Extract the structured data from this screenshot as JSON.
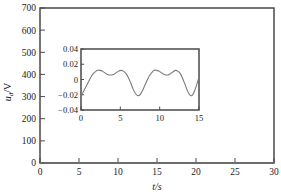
{
  "chart_data": [
    {
      "id": "main",
      "type": "line",
      "title": "",
      "xlabel": "t/s",
      "ylabel": "u_d/V",
      "ylabel_display": "ud/V",
      "xlim": [
        0,
        30
      ],
      "ylim": [
        0,
        700
      ],
      "xticks": [
        0,
        5,
        10,
        15,
        20,
        25,
        30
      ],
      "yticks": [
        0,
        100,
        200,
        300,
        400,
        500,
        600,
        700
      ],
      "xticklabels": [
        "0",
        "5",
        "10",
        "15",
        "20",
        "25",
        "30"
      ],
      "yticklabels": [
        "0",
        "100",
        "200",
        "300",
        "400",
        "500",
        "600",
        "700"
      ],
      "grid": false,
      "legend": null,
      "series": [
        {
          "name": "u_d",
          "comment": "flat trace essentially at zero across full span",
          "x": [
            0,
            1,
            2,
            3,
            4,
            5,
            6,
            7,
            8,
            9,
            10,
            11,
            12,
            13,
            14,
            15,
            16,
            17,
            18,
            19,
            20,
            21,
            22,
            23,
            24,
            25,
            26,
            27,
            28,
            29,
            30
          ],
          "values": [
            0.5,
            0.6,
            0.4,
            0.5,
            0.6,
            0.5,
            0.4,
            0.5,
            0.6,
            0.5,
            0.4,
            0.5,
            0.6,
            0.5,
            0.4,
            0.5,
            0.6,
            0.5,
            0.4,
            0.5,
            0.6,
            0.5,
            0.4,
            0.5,
            0.6,
            0.5,
            0.4,
            0.5,
            0.6,
            0.5,
            0.4
          ]
        }
      ]
    },
    {
      "id": "inset",
      "type": "line",
      "title": "",
      "xlabel": "",
      "ylabel": "",
      "xlim": [
        0,
        15
      ],
      "ylim": [
        -0.04,
        0.04
      ],
      "xticks": [
        0,
        5,
        10,
        15
      ],
      "yticks": [
        -0.04,
        -0.02,
        0,
        0.02,
        0.04
      ],
      "xticklabels": [
        "0",
        "5",
        "10",
        "15"
      ],
      "yticklabels": [
        "−0.04",
        "−0.02",
        "0",
        "0.02",
        "0.04"
      ],
      "grid": false,
      "legend": null,
      "series": [
        {
          "name": "u_d detail",
          "comment": "quasi-periodic ripple, period about 6 s, twin crests then deep trough",
          "x": [
            0.0,
            0.3,
            0.6,
            0.9,
            1.2,
            1.5,
            1.8,
            2.1,
            2.4,
            2.7,
            3.0,
            3.3,
            3.6,
            3.9,
            4.2,
            4.5,
            4.8,
            5.1,
            5.4,
            5.7,
            6.0,
            6.3,
            6.6,
            6.9,
            7.2,
            7.5,
            7.8,
            8.1,
            8.4,
            8.7,
            9.0,
            9.3,
            9.6,
            9.9,
            10.2,
            10.5,
            10.8,
            11.1,
            11.4,
            11.7,
            12.0,
            12.3,
            12.6,
            12.9,
            13.2,
            13.5,
            13.8,
            14.1,
            14.4,
            14.7,
            15.0
          ],
          "values": [
            -0.021,
            -0.016,
            -0.01,
            -0.004,
            0.002,
            0.007,
            0.01,
            0.012,
            0.012,
            0.011,
            0.009,
            0.007,
            0.006,
            0.006,
            0.007,
            0.009,
            0.011,
            0.012,
            0.011,
            0.008,
            0.003,
            -0.004,
            -0.012,
            -0.018,
            -0.021,
            -0.02,
            -0.015,
            -0.008,
            -0.001,
            0.005,
            0.009,
            0.012,
            0.012,
            0.011,
            0.009,
            0.007,
            0.006,
            0.006,
            0.008,
            0.01,
            0.012,
            0.011,
            0.008,
            0.002,
            -0.006,
            -0.014,
            -0.02,
            -0.021,
            -0.016,
            -0.007,
            0.003
          ]
        }
      ]
    }
  ],
  "main_axis": {
    "xlabel": "t/s",
    "ylabel_parts": {
      "base": "u",
      "sub": "d",
      "unit": "/V"
    }
  }
}
